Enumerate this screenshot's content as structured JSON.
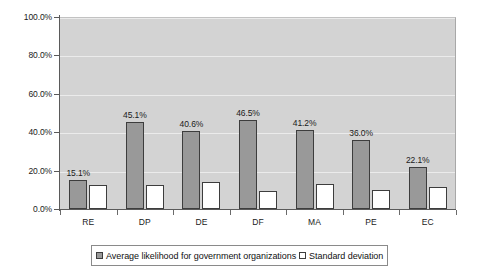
{
  "chart_data": {
    "type": "bar",
    "title": "",
    "subtitle": "",
    "xlabel": "",
    "ylabel": "",
    "categories": [
      "RE",
      "DP",
      "DE",
      "DF",
      "MA",
      "PE",
      "EC"
    ],
    "series": [
      {
        "name": "Average likelihood for government organizations",
        "values": [
          15.1,
          45.1,
          40.6,
          46.5,
          41.2,
          36.0,
          22.1
        ],
        "value_labels": [
          "15.1%",
          "45.1%",
          "40.6%",
          "46.5%",
          "41.2%",
          "36.0%",
          "22.1%"
        ],
        "color": "#999999",
        "border_color": "#3d3d3d",
        "labels_shown": true
      },
      {
        "name": "Standard deviation",
        "values": [
          12.5,
          12.5,
          14.0,
          9.5,
          13.0,
          10.0,
          11.5
        ],
        "value_labels": [
          "",
          "",
          "",
          "",
          "",
          "",
          ""
        ],
        "color": "#ffffff",
        "border_color": "#3d3d3d",
        "labels_shown": false
      }
    ],
    "ylim": [
      0,
      100
    ],
    "y_ticks": [
      0,
      20,
      40,
      60,
      80,
      100
    ],
    "y_tick_labels": [
      "0.0%",
      "20.0%",
      "40.0%",
      "60.0%",
      "80.0%",
      "100.0%"
    ],
    "grid": true,
    "grid_axis": "y",
    "grid_color": "#ebebeb",
    "plot_background": "#d3d3d3",
    "figure_background": "#ffffff",
    "legend_position": "bottom",
    "legend_border": true,
    "annotations": []
  },
  "legend": {
    "entries": [
      {
        "label": "Average likelihood for government organizations",
        "swatch": "filled-gray-square"
      },
      {
        "label": "Standard deviation",
        "swatch": "empty-white-square"
      }
    ]
  }
}
